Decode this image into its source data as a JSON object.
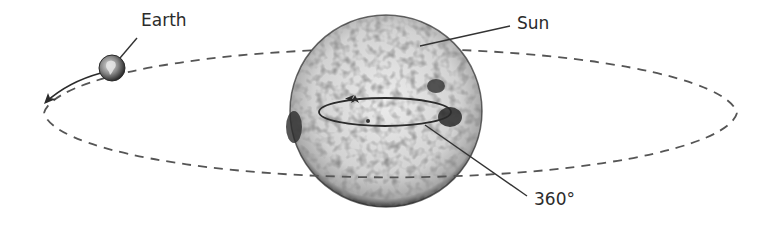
{
  "diagram": {
    "type": "solar-rotation-orbit",
    "labels": {
      "earth": "Earth",
      "sun": "Sun",
      "rotation": "360°"
    },
    "icons": {
      "earth": "earth-globe-icon",
      "sun": "sun-sphere-icon"
    },
    "colors": {
      "line": "#333333",
      "orbit_dash": "#555555",
      "sun_fill": "#d9d9d9",
      "sun_spots": "#5a5a5a",
      "earth_fill": "#6e6e6e",
      "background": "#ffffff"
    }
  }
}
